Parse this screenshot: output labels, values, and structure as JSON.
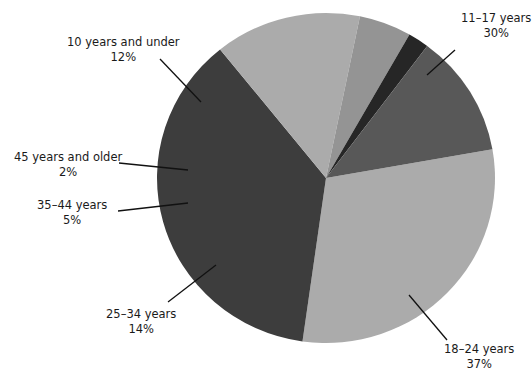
{
  "chart_data": {
    "type": "pie",
    "title": "",
    "subtitle": "",
    "xlabel": "",
    "ylabel": "",
    "legend_position": "none",
    "grid": false,
    "units": "percent",
    "categories": [
      "11–17 years",
      "18–24 years",
      "25–34 years",
      "35–44 years",
      "45 years and older",
      "10 years and under"
    ],
    "values": [
      30,
      37,
      14,
      5,
      2,
      12
    ],
    "colors": [
      "#ababab",
      "#3d3d3d",
      "#ababab",
      "#949494",
      "#262626",
      "#585858"
    ],
    "slices": [
      {
        "id": "slice-11-17",
        "label": "11–17 years",
        "percent_text": "30%",
        "value": 30,
        "color": "#ababab",
        "start_deg": -10,
        "end_deg": 98,
        "label_x": 461,
        "label_y": 11,
        "align": "left",
        "leader": {
          "x1": 455,
          "y1": 50,
          "x2": 427,
          "y2": 75
        }
      },
      {
        "id": "slice-18-24",
        "label": "18–24 years",
        "percent_text": "37%",
        "value": 37,
        "color": "#3d3d3d",
        "start_deg": 98,
        "end_deg": 231.2,
        "label_x": 444,
        "label_y": 342,
        "align": "left",
        "leader": {
          "x1": 447,
          "y1": 340,
          "x2": 409,
          "y2": 295
        }
      },
      {
        "id": "slice-25-34",
        "label": "25–34 years",
        "percent_text": "14%",
        "value": 14,
        "color": "#ababab",
        "start_deg": 231.2,
        "end_deg": 281.6,
        "label_x": 106,
        "label_y": 307,
        "align": "left",
        "leader": {
          "x1": 168,
          "y1": 302,
          "x2": 216,
          "y2": 265
        }
      },
      {
        "id": "slice-35-44",
        "label": "35–44 years",
        "percent_text": "5%",
        "value": 5,
        "color": "#949494",
        "start_deg": 281.6,
        "end_deg": 299.6,
        "label_x": 37,
        "label_y": 198,
        "align": "left",
        "leader": {
          "x1": 118,
          "y1": 211,
          "x2": 188,
          "y2": 203
        }
      },
      {
        "id": "slice-45-plus",
        "label": "45 years and older",
        "percent_text": "2%",
        "value": 2,
        "color": "#262626",
        "start_deg": 299.6,
        "end_deg": 306.8,
        "label_x": 14,
        "label_y": 150,
        "align": "left",
        "leader": {
          "x1": 119,
          "y1": 163,
          "x2": 188,
          "y2": 170
        }
      },
      {
        "id": "slice-10-under",
        "label": "10 years and under",
        "percent_text": "12%",
        "value": 12,
        "color": "#585858",
        "start_deg": 306.8,
        "end_deg": 350,
        "label_x": 67,
        "label_y": 35,
        "align": "left",
        "leader": {
          "x1": 160,
          "y1": 59,
          "x2": 201,
          "y2": 102
        }
      }
    ],
    "geometry": {
      "center_x": 326,
      "center_y": 178,
      "radius_x": 169,
      "radius_y": 165
    }
  }
}
